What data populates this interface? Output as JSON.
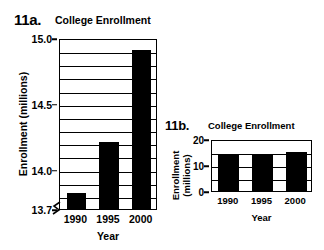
{
  "chart_data": [
    {
      "type": "bar",
      "panel_label": "11a.",
      "title": "College Enrollment",
      "categories": [
        "1990",
        "1995",
        "2000"
      ],
      "values": [
        13.82,
        14.21,
        14.91
      ],
      "xlabel": "Year",
      "ylabel": "Enrollment (millions)",
      "ylim": [
        13.7,
        15.0
      ],
      "yticks": [
        13.7,
        14.0,
        14.5,
        15.0
      ],
      "ytick_labels": [
        "13.7",
        "14.0",
        "14.5",
        "15.0"
      ],
      "minor_gridlines": [
        13.8,
        13.9,
        14.0,
        14.1,
        14.2,
        14.3,
        14.4,
        14.5,
        14.6,
        14.7,
        14.8,
        14.9
      ],
      "grid": true,
      "axis_break": true,
      "legend": "none",
      "bar_color": "#000000",
      "background_color": "#ffffff"
    },
    {
      "type": "bar",
      "panel_label": "11b.",
      "title": "College Enrollment",
      "categories": [
        "1990",
        "1995",
        "2000"
      ],
      "values": [
        13.82,
        14.21,
        14.91
      ],
      "xlabel": "Year",
      "ylabel": "Enrollment (millions)",
      "ylabel_line1": "Enrollment",
      "ylabel_line2": "(millions)",
      "ylim": [
        0,
        20
      ],
      "yticks": [
        0,
        10,
        20
      ],
      "ytick_labels": [
        "0",
        "10",
        "20"
      ],
      "minor_gridlines": [
        5,
        15
      ],
      "grid": true,
      "axis_break": false,
      "legend": "none",
      "bar_color": "#000000",
      "background_color": "#ffffff"
    }
  ]
}
